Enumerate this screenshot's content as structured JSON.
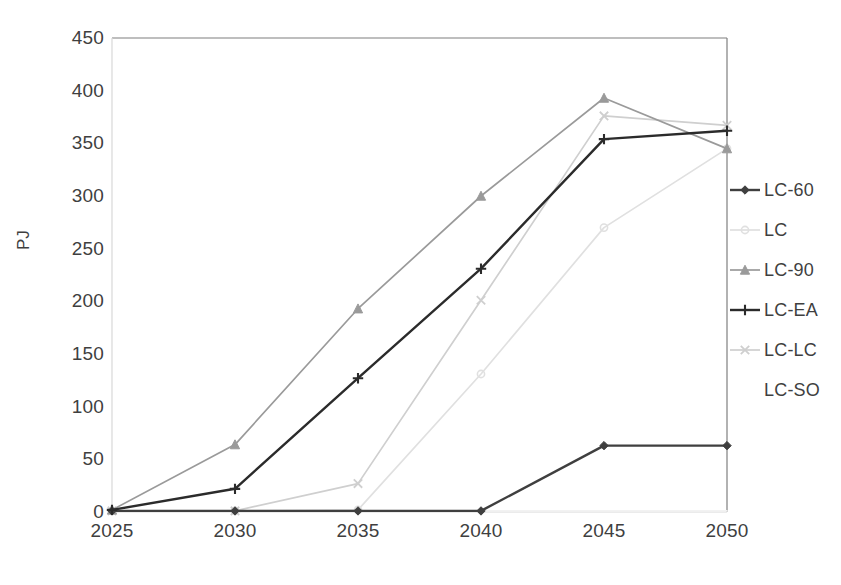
{
  "chart_data": {
    "type": "line",
    "title": "",
    "xlabel": "",
    "ylabel": "PJ",
    "x": [
      2025,
      2030,
      2035,
      2040,
      2045,
      2050
    ],
    "categories": [
      "2025",
      "2030",
      "2035",
      "2040",
      "2045",
      "2050"
    ],
    "xlim": [
      2025,
      2050
    ],
    "ylim": [
      0,
      450
    ],
    "ytick_values": [
      0,
      50,
      100,
      150,
      200,
      250,
      300,
      350,
      400,
      450
    ],
    "ytick_labels": [
      "0",
      "50",
      "100",
      "150",
      "200",
      "250",
      "300",
      "350",
      "400",
      "450"
    ],
    "xtick_labels": [
      "2025",
      "2030",
      "2035",
      "2040",
      "2045",
      "2050"
    ],
    "grid": false,
    "legend_position": "right",
    "series": [
      {
        "name": "LC-60",
        "color": "#3f3f3f",
        "marker": "diamond",
        "values": [
          1,
          1,
          1,
          1,
          63,
          63
        ]
      },
      {
        "name": "LC",
        "color": "#e0e0e0",
        "marker": "circle",
        "values": [
          1,
          1,
          2,
          131,
          270,
          345
        ]
      },
      {
        "name": "LC-90",
        "color": "#9a9a9a",
        "marker": "triangle",
        "values": [
          2,
          64,
          193,
          300,
          393,
          345
        ]
      },
      {
        "name": "LC-EA",
        "color": "#2b2b2b",
        "marker": "cross",
        "values": [
          2,
          22,
          127,
          231,
          354,
          362
        ]
      },
      {
        "name": "LC-LC",
        "color": "#cfcfcf",
        "marker": "x",
        "values": [
          1,
          1,
          27,
          201,
          376,
          367
        ]
      },
      {
        "name": "LC-SO",
        "color": "#f2f2f2",
        "marker": "none",
        "values": [
          1,
          1,
          1,
          1,
          1,
          1
        ]
      }
    ]
  },
  "legend": {
    "items": [
      {
        "label": "LC-60"
      },
      {
        "label": "LC"
      },
      {
        "label": "LC-90"
      },
      {
        "label": "LC-EA"
      },
      {
        "label": "LC-LC"
      },
      {
        "label": "LC-SO"
      }
    ]
  },
  "axes": {
    "y_title": "PJ",
    "border_color": "#7f7f7f"
  }
}
